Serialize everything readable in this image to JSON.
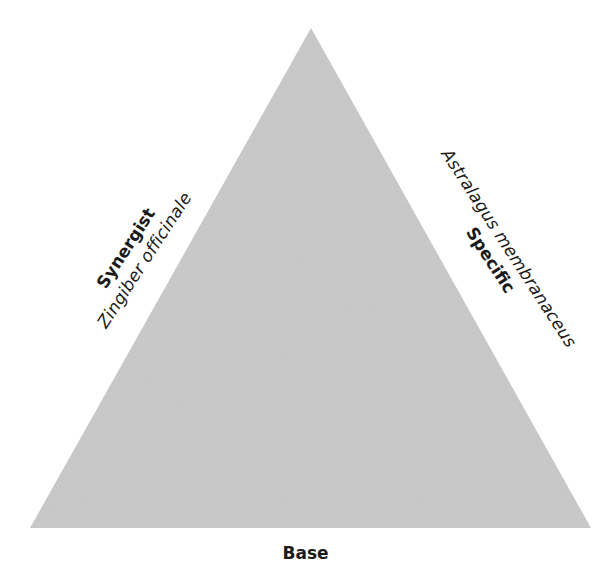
{
  "diagram": {
    "shape": "triangle",
    "fill_color": "#c9c9c9",
    "background_color": "#ffffff",
    "vertices": {
      "apex": [
        311,
        28
      ],
      "bottom_left": [
        30,
        528
      ],
      "bottom_right": [
        591,
        528
      ]
    },
    "sides": {
      "left": {
        "title": "Synergist",
        "species": "Zingiber officinale"
      },
      "right": {
        "title": "Specific",
        "species": "Astralagus membranaceus"
      },
      "bottom": {
        "title": "Base"
      }
    }
  }
}
